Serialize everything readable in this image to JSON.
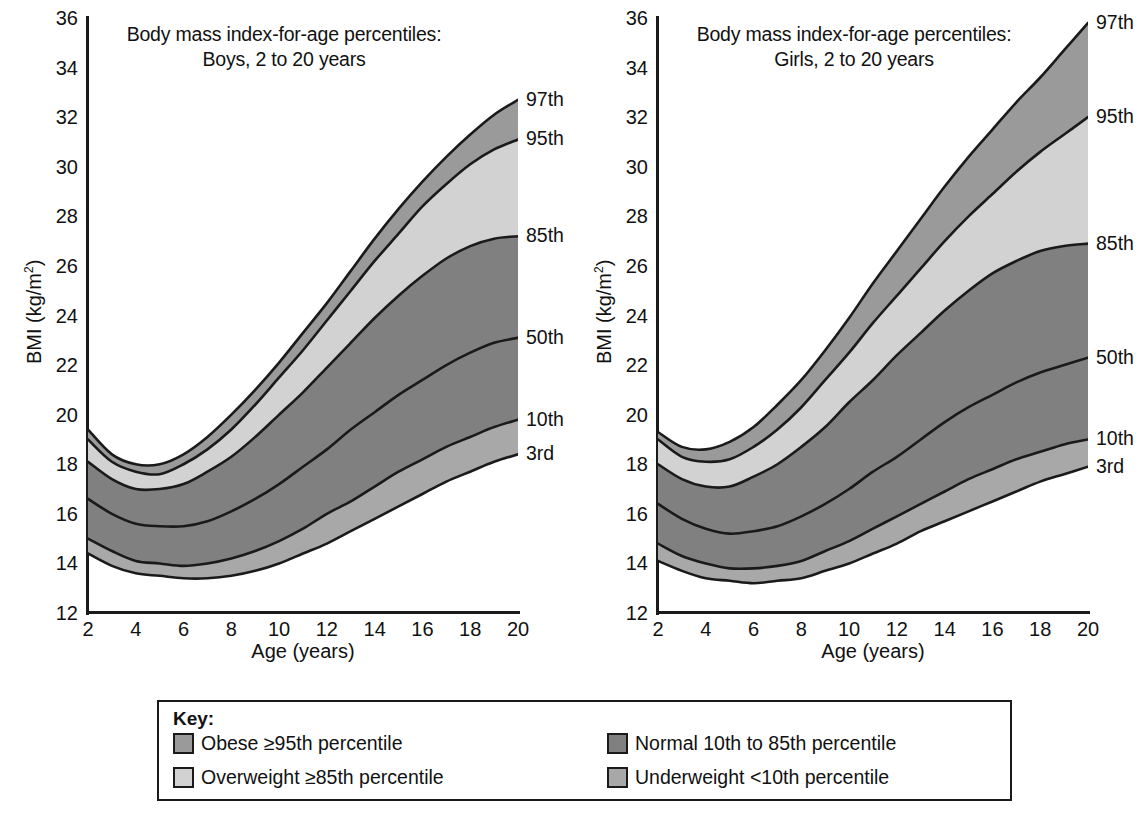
{
  "figure": {
    "background": "#ffffff",
    "width": 1140,
    "height": 819
  },
  "colors": {
    "obese": "#9a9a9a",
    "overweight": "#d2d2d2",
    "normal": "#808080",
    "underweight": "#a8a8a8",
    "line": "#1a1a1a",
    "text": "#111111",
    "plot_background": "#ffffff"
  },
  "panels": [
    {
      "id": "boys",
      "title_line1": "Body mass index-for-age percentiles:",
      "title_line2": "Boys, 2 to 20 years",
      "ylabel_prefix": "BMI (kg/m",
      "ylabel_sup": "2",
      "ylabel_suffix": ")",
      "xlabel": "Age (years)",
      "curve_labels": [
        "97th",
        "95th",
        "85th",
        "50th",
        "10th",
        "3rd"
      ]
    },
    {
      "id": "girls",
      "title_line1": "Body mass index-for-age percentiles:",
      "title_line2": "Girls, 2 to 20 years",
      "ylabel_prefix": "BMI (kg/m",
      "ylabel_sup": "2",
      "ylabel_suffix": ")",
      "xlabel": "Age (years)",
      "curve_labels": [
        "97th",
        "95th",
        "85th",
        "50th",
        "10th",
        "3rd"
      ]
    }
  ],
  "key": {
    "title": "Key:",
    "items": [
      {
        "label": "Obese ≥95th percentile",
        "color": "#9a9a9a",
        "band": "obese"
      },
      {
        "label": "Overweight ≥85th percentile",
        "color": "#d2d2d2",
        "band": "overweight"
      },
      {
        "label": "Normal 10th to 85th percentile",
        "color": "#808080",
        "band": "normal"
      },
      {
        "label": "Underweight <10th percentile",
        "color": "#a8a8a8",
        "band": "underweight"
      }
    ]
  },
  "chart_data": {
    "type": "area",
    "xlabel": "Age (years)",
    "ylabel": "BMI (kg/m2)",
    "xlim": [
      2,
      20
    ],
    "ylim": [
      12,
      36
    ],
    "xticks": [
      2,
      4,
      6,
      8,
      10,
      12,
      14,
      16,
      18,
      20
    ],
    "yticks": [
      12,
      14,
      16,
      18,
      20,
      22,
      24,
      26,
      28,
      30,
      32,
      34,
      36
    ],
    "grid": false,
    "legend_position": "bottom",
    "x": [
      2,
      3,
      4,
      5,
      6,
      7,
      8,
      9,
      10,
      11,
      12,
      13,
      14,
      15,
      16,
      17,
      18,
      19,
      20
    ],
    "charts": [
      {
        "name": "Boys, 2 to 20 years",
        "series": [
          {
            "name": "97th",
            "values": [
              19.4,
              18.4,
              18.0,
              18.0,
              18.4,
              19.1,
              20.0,
              21.0,
              22.1,
              23.3,
              24.5,
              25.8,
              27.1,
              28.3,
              29.4,
              30.4,
              31.3,
              32.1,
              32.7
            ]
          },
          {
            "name": "95th",
            "values": [
              19.0,
              18.1,
              17.7,
              17.6,
              18.0,
              18.6,
              19.4,
              20.4,
              21.5,
              22.6,
              23.8,
              25.0,
              26.2,
              27.3,
              28.4,
              29.3,
              30.1,
              30.7,
              31.1
            ]
          },
          {
            "name": "85th",
            "values": [
              18.1,
              17.4,
              17.0,
              17.0,
              17.2,
              17.7,
              18.3,
              19.1,
              20.0,
              20.9,
              21.9,
              22.9,
              23.9,
              24.8,
              25.6,
              26.3,
              26.8,
              27.1,
              27.2
            ]
          },
          {
            "name": "50th",
            "values": [
              16.6,
              16.0,
              15.6,
              15.5,
              15.5,
              15.7,
              16.1,
              16.6,
              17.2,
              17.9,
              18.6,
              19.4,
              20.1,
              20.8,
              21.4,
              22.0,
              22.5,
              22.9,
              23.1
            ]
          },
          {
            "name": "10th",
            "values": [
              15.0,
              14.5,
              14.1,
              14.0,
              13.9,
              14.0,
              14.2,
              14.5,
              14.9,
              15.4,
              16.0,
              16.5,
              17.1,
              17.7,
              18.2,
              18.7,
              19.1,
              19.5,
              19.8
            ]
          },
          {
            "name": "3rd",
            "values": [
              14.4,
              13.9,
              13.6,
              13.5,
              13.4,
              13.4,
              13.5,
              13.7,
              14.0,
              14.4,
              14.8,
              15.3,
              15.8,
              16.3,
              16.8,
              17.3,
              17.7,
              18.1,
              18.4
            ]
          }
        ]
      },
      {
        "name": "Girls, 2 to 20 years",
        "series": [
          {
            "name": "97th",
            "values": [
              19.3,
              18.7,
              18.6,
              18.9,
              19.5,
              20.4,
              21.4,
              22.6,
              23.9,
              25.3,
              26.6,
              27.9,
              29.2,
              30.4,
              31.5,
              32.6,
              33.6,
              34.7,
              35.8
            ]
          },
          {
            "name": "95th",
            "values": [
              19.0,
              18.3,
              18.1,
              18.2,
              18.7,
              19.4,
              20.3,
              21.4,
              22.5,
              23.7,
              24.8,
              25.9,
              27.0,
              28.0,
              28.9,
              29.8,
              30.6,
              31.3,
              32.0
            ]
          },
          {
            "name": "85th",
            "values": [
              18.0,
              17.4,
              17.1,
              17.1,
              17.5,
              18.0,
              18.7,
              19.5,
              20.5,
              21.4,
              22.4,
              23.3,
              24.2,
              25.0,
              25.7,
              26.2,
              26.6,
              26.8,
              26.9
            ]
          },
          {
            "name": "50th",
            "values": [
              16.4,
              15.8,
              15.4,
              15.2,
              15.3,
              15.5,
              15.9,
              16.4,
              17.0,
              17.7,
              18.3,
              19.0,
              19.7,
              20.3,
              20.8,
              21.3,
              21.7,
              22.0,
              22.3
            ]
          },
          {
            "name": "10th",
            "values": [
              14.8,
              14.3,
              14.0,
              13.8,
              13.8,
              13.9,
              14.1,
              14.5,
              14.9,
              15.4,
              15.9,
              16.4,
              16.9,
              17.4,
              17.8,
              18.2,
              18.5,
              18.8,
              19.0
            ]
          },
          {
            "name": "3rd",
            "values": [
              14.1,
              13.7,
              13.4,
              13.3,
              13.2,
              13.3,
              13.4,
              13.7,
              14.0,
              14.4,
              14.8,
              15.3,
              15.7,
              16.1,
              16.5,
              16.9,
              17.3,
              17.6,
              17.9
            ]
          }
        ]
      }
    ],
    "bands": [
      {
        "name": "Obese ≥95th percentile",
        "between": [
          "95th",
          "97th"
        ],
        "color": "#9a9a9a"
      },
      {
        "name": "Overweight ≥85th percentile",
        "between": [
          "85th",
          "95th"
        ],
        "color": "#d2d2d2"
      },
      {
        "name": "Normal 10th to 85th percentile",
        "between": [
          "10th",
          "85th"
        ],
        "color": "#808080"
      },
      {
        "name": "Underweight <10th percentile",
        "between": [
          "3rd",
          "10th"
        ],
        "color": "#a8a8a8"
      }
    ]
  }
}
